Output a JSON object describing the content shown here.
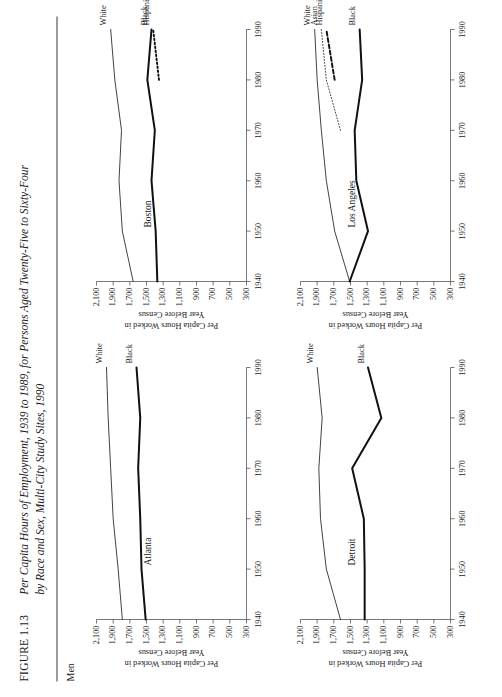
{
  "figure": {
    "number": "FIGURE 1.13",
    "caption_line1": "Per Capita Hours of Employment, 1939 to 1989, for Persons Aged Twenty-Five to Sixty-Four",
    "caption_line2": "by Race and Sex, Multi-City Study Sites, 1990",
    "section_header": "Men"
  },
  "axes": {
    "ylabel_line1": "Per Capita Hours Worked in",
    "ylabel_line2": "Year Before Census",
    "yticks": [
      "2,100",
      "1,900",
      "1,700",
      "1,500",
      "1,300",
      "1,100",
      "900",
      "700",
      "500",
      "300"
    ],
    "xticks": [
      "1940",
      "1950",
      "1960",
      "1970",
      "1980",
      "1990"
    ],
    "ylim": [
      300,
      2100
    ],
    "xlim": [
      1940,
      1990
    ]
  },
  "chart_data": [
    {
      "type": "line",
      "title": "Atlanta",
      "xlabel": "",
      "ylabel": "Per Capita Hours Worked in Year Before Census",
      "x": [
        1940,
        1950,
        1960,
        1970,
        1980,
        1990
      ],
      "ylim": [
        300,
        2100
      ],
      "xlim": [
        1940,
        1990
      ],
      "grid": false,
      "legend": "inline-right",
      "series": [
        {
          "name": "White",
          "style": "thin-solid",
          "values": [
            1790,
            1840,
            1900,
            1930,
            1960,
            1980
          ]
        },
        {
          "name": "Black",
          "style": "thick-solid",
          "values": [
            1510,
            1560,
            1575,
            1600,
            1575,
            1620
          ]
        }
      ]
    },
    {
      "type": "line",
      "title": "Boston",
      "xlabel": "",
      "ylabel": "Per Capita Hours Worked in Year Before Census",
      "x": [
        1940,
        1950,
        1960,
        1970,
        1980,
        1990
      ],
      "ylim": [
        300,
        2100
      ],
      "xlim": [
        1940,
        1990
      ],
      "grid": false,
      "legend": "inline-right",
      "series": [
        {
          "name": "White",
          "style": "thin-solid",
          "values": [
            1660,
            1790,
            1830,
            1800,
            1880,
            1930
          ]
        },
        {
          "name": "Black",
          "style": "thick-solid",
          "values": [
            1370,
            1390,
            1440,
            1400,
            1490,
            1440
          ]
        },
        {
          "name": "Hispanic",
          "style": "dotted",
          "values": [
            null,
            null,
            null,
            null,
            1350,
            1420
          ]
        }
      ]
    },
    {
      "type": "line",
      "title": "Detroit",
      "xlabel": "",
      "ylabel": "Per Capita Hours Worked in Year Before Census",
      "x": [
        1940,
        1950,
        1960,
        1970,
        1980,
        1990
      ],
      "ylim": [
        300,
        2100
      ],
      "xlim": [
        1940,
        1990
      ],
      "grid": false,
      "legend": "inline-right",
      "series": [
        {
          "name": "White",
          "style": "thin-solid",
          "values": [
            1620,
            1790,
            1860,
            1880,
            1840,
            1900
          ]
        },
        {
          "name": "Black",
          "style": "thick-solid",
          "values": [
            1330,
            1330,
            1340,
            1480,
            1130,
            1290
          ]
        }
      ]
    },
    {
      "type": "line",
      "title": "Los Angeles",
      "xlabel": "",
      "ylabel": "Per Capita Hours Worked in Year Before Census",
      "x": [
        1940,
        1950,
        1960,
        1970,
        1980,
        1990
      ],
      "ylim": [
        300,
        2100
      ],
      "xlim": [
        1940,
        1990
      ],
      "grid": false,
      "legend": "inline-right",
      "series": [
        {
          "name": "White",
          "style": "thin-solid",
          "values": [
            1510,
            1690,
            1790,
            1850,
            1900,
            1930
          ]
        },
        {
          "name": "Asian",
          "style": "fine-dotted",
          "values": [
            null,
            null,
            null,
            1620,
            1790,
            1850
          ]
        },
        {
          "name": "Hispanic",
          "style": "dashed",
          "values": [
            null,
            null,
            null,
            null,
            1690,
            1790
          ]
        },
        {
          "name": "Black",
          "style": "thick-solid",
          "values": [
            1510,
            1290,
            1430,
            1450,
            1360,
            1390
          ]
        }
      ]
    }
  ]
}
